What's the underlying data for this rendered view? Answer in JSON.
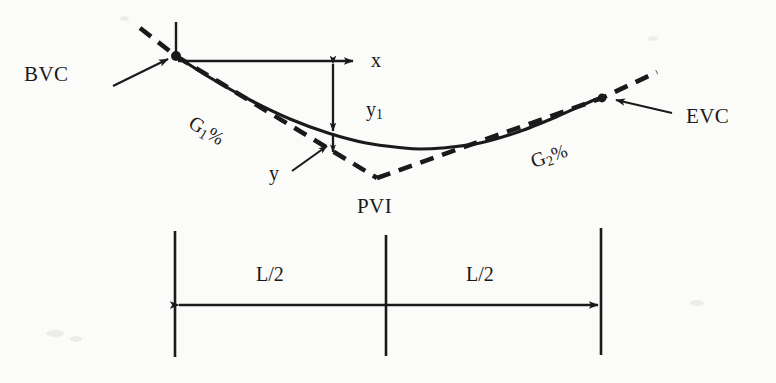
{
  "figure": {
    "background_color": "#fbfbf9",
    "ink_color": "#1a1a1a"
  },
  "labels": {
    "bvc": "BVC",
    "evc": "EVC",
    "pvi": "PVI",
    "x_axis": "x",
    "y1": "y",
    "y1_sub": "1",
    "y_offset": "y",
    "g1_letter": "G",
    "g1_sub": "1",
    "g1_pct": "%",
    "g2_letter": "G",
    "g2_sub": "2",
    "g2_pct": "%",
    "half_length_left": "L/2",
    "half_length_right": "L/2"
  },
  "geometry": {
    "bvc_point": [
      176,
      56
    ],
    "evc_point": [
      602,
      98
    ],
    "pvi_point": [
      377,
      178
    ],
    "curve_low_point": [
      420,
      149
    ],
    "x_axis_arrow_end": [
      357,
      61
    ],
    "y1_measure_x": 333,
    "y1_top": [
      333,
      61
    ],
    "y1_bottom": [
      333,
      134
    ],
    "y_bottom": [
      333,
      151
    ],
    "dim_line_y": 305,
    "dim_left_x": 175,
    "dim_center_x": 386,
    "dim_right_x": 601,
    "dim_tick_top": 231,
    "dim_tick_bottom": 357
  },
  "chart_data": {
    "type": "line",
    "xlabel": "x",
    "ylabel": "y",
    "grid": false,
    "legend": false,
    "annotations": [
      "BVC",
      "EVC",
      "PVI",
      "G1%",
      "G2%",
      "L/2",
      "L/2",
      "x",
      "y1",
      "y"
    ],
    "series": [
      {
        "name": "parabolic vertical curve (solid)",
        "style": "solid",
        "points": [
          [
            176,
            56
          ],
          [
            214,
            80
          ],
          [
            252,
            101
          ],
          [
            290,
            119
          ],
          [
            328,
            133
          ],
          [
            366,
            143
          ],
          [
            404,
            148
          ],
          [
            420,
            149
          ],
          [
            442,
            148
          ],
          [
            480,
            143
          ],
          [
            518,
            132
          ],
          [
            556,
            117
          ],
          [
            594,
            100
          ],
          [
            602,
            98
          ]
        ]
      },
      {
        "name": "grade G1 tangent (dashed)",
        "style": "dashed",
        "points": [
          [
            140,
            28
          ],
          [
            176,
            56
          ],
          [
            377,
            178
          ]
        ]
      },
      {
        "name": "grade G2 tangent (dashed)",
        "style": "dashed",
        "points": [
          [
            377,
            178
          ],
          [
            602,
            98
          ],
          [
            657,
            72
          ]
        ]
      }
    ]
  }
}
